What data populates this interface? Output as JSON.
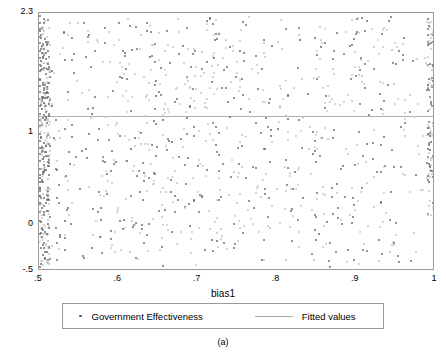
{
  "figure": {
    "caption": "(a)"
  },
  "legend": {
    "points_label": "Government Effectiveness",
    "fit_label": "Fitted values"
  },
  "chart_data": {
    "type": "scatter",
    "title": "",
    "xlabel": "bias1",
    "ylabel": "",
    "xlim": [
      0.5,
      1.0
    ],
    "ylim": [
      -0.5,
      2.3
    ],
    "xticks": [
      0.5,
      0.6,
      0.7,
      0.8,
      0.9,
      1.0
    ],
    "xticklabels": [
      ".5",
      ".6",
      ".7",
      ".8",
      ".9",
      "1"
    ],
    "yticks": [
      -0.5,
      0,
      1,
      2.3
    ],
    "yticklabels": [
      "-.5",
      "0",
      "1",
      "2.3"
    ],
    "grid": false,
    "legend_position": "below-plot",
    "series": [
      {
        "name": "Government Effectiveness",
        "marker": "dot",
        "color": "#6e6e6e",
        "points": [
          [
            0.5,
            2.28
          ],
          [
            0.5,
            2.2
          ],
          [
            0.5,
            2.12
          ],
          [
            0.5,
            2.05
          ],
          [
            0.5,
            1.98
          ],
          [
            0.5,
            1.9
          ],
          [
            0.5,
            1.82
          ],
          [
            0.5,
            1.75
          ],
          [
            0.5,
            1.68
          ],
          [
            0.5,
            1.6
          ],
          [
            0.5,
            1.52
          ],
          [
            0.5,
            1.45
          ],
          [
            0.5,
            1.38
          ],
          [
            0.5,
            1.3
          ],
          [
            0.5,
            1.22
          ],
          [
            0.5,
            1.15
          ],
          [
            0.5,
            1.08
          ],
          [
            0.5,
            1.0
          ],
          [
            0.5,
            0.92
          ],
          [
            0.5,
            0.85
          ],
          [
            0.5,
            0.78
          ],
          [
            0.5,
            0.7
          ],
          [
            0.5,
            0.62
          ],
          [
            0.5,
            0.55
          ],
          [
            0.5,
            0.48
          ],
          [
            0.5,
            0.4
          ],
          [
            0.5,
            0.32
          ],
          [
            0.5,
            0.25
          ],
          [
            0.5,
            0.15
          ],
          [
            0.5,
            0.05
          ],
          [
            0.502,
            2.15
          ],
          [
            0.502,
            1.95
          ],
          [
            0.502,
            1.7
          ],
          [
            0.502,
            1.4
          ],
          [
            0.502,
            1.1
          ],
          [
            0.502,
            0.8
          ],
          [
            0.502,
            0.5
          ],
          [
            0.502,
            0.2
          ],
          [
            0.505,
            2.25
          ],
          [
            0.505,
            1.85
          ],
          [
            0.505,
            1.5
          ],
          [
            0.505,
            1.2
          ],
          [
            0.505,
            0.9
          ],
          [
            0.505,
            0.6
          ],
          [
            0.505,
            0.3
          ],
          [
            0.51,
            2.0
          ],
          [
            0.512,
            1.62
          ],
          [
            0.515,
            1.3
          ],
          [
            0.518,
            0.95
          ],
          [
            0.52,
            0.62
          ],
          [
            0.522,
            0.3
          ],
          [
            0.525,
            -0.1
          ],
          [
            0.53,
            2.1
          ],
          [
            0.532,
            1.8
          ],
          [
            0.535,
            1.45
          ],
          [
            0.54,
            1.1
          ],
          [
            0.545,
            0.75
          ],
          [
            0.55,
            0.4
          ],
          [
            0.555,
            -0.35
          ],
          [
            0.56,
            2.05
          ],
          [
            0.565,
            1.72
          ],
          [
            0.57,
            1.4
          ],
          [
            0.575,
            1.05
          ],
          [
            0.58,
            0.7
          ],
          [
            0.585,
            0.35
          ],
          [
            0.59,
            -0.05
          ],
          [
            0.6,
            2.2
          ],
          [
            0.605,
            1.9
          ],
          [
            0.61,
            1.6
          ],
          [
            0.615,
            1.25
          ],
          [
            0.62,
            0.95
          ],
          [
            0.625,
            0.6
          ],
          [
            0.63,
            0.28
          ],
          [
            0.635,
            -0.1
          ],
          [
            0.64,
            2.1
          ],
          [
            0.645,
            1.78
          ],
          [
            0.65,
            1.45
          ],
          [
            0.655,
            1.15
          ],
          [
            0.66,
            0.82
          ],
          [
            0.665,
            0.5
          ],
          [
            0.67,
            0.15
          ],
          [
            0.68,
            1.95
          ],
          [
            0.685,
            1.62
          ],
          [
            0.69,
            1.3
          ],
          [
            0.695,
            0.98
          ],
          [
            0.7,
            0.65
          ],
          [
            0.705,
            0.32
          ],
          [
            0.72,
            1.82
          ],
          [
            0.73,
            1.5
          ],
          [
            0.74,
            1.18
          ],
          [
            0.75,
            0.85
          ],
          [
            0.76,
            0.52
          ],
          [
            0.77,
            0.2
          ],
          [
            0.78,
            1.7
          ],
          [
            0.79,
            1.38
          ],
          [
            0.8,
            1.05
          ],
          [
            0.81,
            0.72
          ],
          [
            0.82,
            0.4
          ],
          [
            0.85,
            1.6
          ],
          [
            0.86,
            1.28
          ],
          [
            0.87,
            0.95
          ],
          [
            0.88,
            0.62
          ],
          [
            0.9,
            2.1
          ],
          [
            0.905,
            1.82
          ],
          [
            0.91,
            1.5
          ],
          [
            0.915,
            1.2
          ],
          [
            0.92,
            0.9
          ],
          [
            0.925,
            0.58
          ],
          [
            0.93,
            0.25
          ],
          [
            0.99,
            2.25
          ],
          [
            0.99,
            2.0
          ],
          [
            0.99,
            1.75
          ],
          [
            0.99,
            1.5
          ],
          [
            0.99,
            1.25
          ],
          [
            0.99,
            1.0
          ],
          [
            0.99,
            0.75
          ],
          [
            0.99,
            0.5
          ],
          [
            1.0,
            2.3
          ],
          [
            1.0,
            2.15
          ],
          [
            1.0,
            2.0
          ],
          [
            1.0,
            1.85
          ],
          [
            1.0,
            1.7
          ],
          [
            1.0,
            1.55
          ],
          [
            1.0,
            1.4
          ],
          [
            1.0,
            1.25
          ],
          [
            1.0,
            1.1
          ],
          [
            1.0,
            0.95
          ],
          [
            1.0,
            0.8
          ],
          [
            1.0,
            0.65
          ],
          [
            1.0,
            0.5
          ],
          [
            1.0,
            0.35
          ],
          [
            1.0,
            0.2
          ]
        ]
      },
      {
        "name": "Fitted values",
        "type": "line",
        "color": "#b0b0b0",
        "y_constant": 1.18,
        "x_range": [
          0.5,
          1.0
        ]
      }
    ]
  }
}
